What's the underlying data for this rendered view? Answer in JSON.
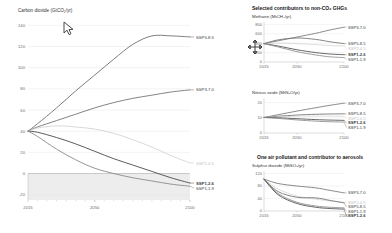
{
  "figure": {
    "background": "#ffffff",
    "line_colors": {
      "ssp585": "#6f6f6f",
      "ssp370": "#757575",
      "ssp245": "#cfcfcf",
      "ssp126": "#4a4a4a",
      "ssp119": "#8a8a8a",
      "grid": "#e6e6e6",
      "axis": "#b5b5b5",
      "negative_band": "#ededed"
    }
  },
  "main": {
    "title": "Carbon dioxide (GtCO₂/yr)",
    "xlabel": "",
    "ylabel": "",
    "xticks": [
      "2015",
      "2050",
      "2100"
    ],
    "yticks": [
      "140",
      "120",
      "100",
      "80",
      "60",
      "40",
      "20",
      "0",
      "-20"
    ],
    "series_labels": {
      "ssp585": "SSP5-8.5",
      "ssp370": "SSP3-7.0",
      "ssp245": "SSP2-4.5",
      "ssp126": "SSP1-2.6",
      "ssp119": "SSP1-1.9"
    }
  },
  "right": {
    "heading": "Selected contributors to non-CO₂ GHGs",
    "pollutant_heading": "One air pollutant and contributor to aerosols",
    "panels": [
      {
        "subtitle": "Methane (MtCH₄/yr)",
        "xticks": [
          "2015",
          "2050",
          "2100"
        ],
        "yticks": [
          "800",
          "600",
          "400",
          "200",
          "0"
        ],
        "labels": [
          "SSP3-7.0",
          "SSP5-8.5",
          "SSP2-4.5",
          "SSP1-2.6",
          "SSP1-1.9"
        ]
      },
      {
        "subtitle": "Nitrous oxide (MtN₂O/yr)",
        "xticks": [
          "2015",
          "2050",
          "2100"
        ],
        "yticks": [
          "20",
          "10",
          "0"
        ],
        "labels": [
          "SSP3-7.0",
          "SSP5-8.5",
          "SSP2-4.5",
          "SSP1-2.6",
          "SSP1-1.9"
        ]
      },
      {
        "subtitle": "Sulphur dioxide (MtSO₂/yr)",
        "xticks": [
          "2015",
          "2050",
          "2100"
        ],
        "yticks": [
          "120",
          "80",
          "40",
          "0"
        ],
        "labels": [
          "SSP3-7.0",
          "SSP2-4.5",
          "SSP5-8.5",
          "SSP1-1.9",
          "SSP1-2.6"
        ]
      }
    ]
  },
  "chart_data": [
    {
      "type": "line",
      "title": "Carbon dioxide (GtCO₂/yr)",
      "xlabel": "",
      "ylabel": "GtCO2/yr",
      "x": [
        2015,
        2020,
        2030,
        2040,
        2050,
        2060,
        2070,
        2080,
        2090,
        2100
      ],
      "xlim": [
        2015,
        2100
      ],
      "ylim": [
        -25,
        145
      ],
      "grid": true,
      "legend_position": "right-inline",
      "series": [
        {
          "name": "SSP5-8.5",
          "values": [
            40,
            47,
            62,
            78,
            93,
            108,
            122,
            130,
            130,
            129
          ]
        },
        {
          "name": "SSP3-7.0",
          "values": [
            40,
            44,
            50,
            56,
            62,
            67,
            71,
            74,
            77,
            79
          ]
        },
        {
          "name": "SSP2-4.5",
          "values": [
            40,
            43,
            45,
            44,
            42,
            38,
            32,
            25,
            17,
            10
          ]
        },
        {
          "name": "SSP1-2.6",
          "values": [
            40,
            39,
            34,
            28,
            21,
            14,
            8,
            2,
            -4,
            -9
          ]
        },
        {
          "name": "SSP1-1.9",
          "values": [
            40,
            35,
            23,
            13,
            5,
            0,
            -4,
            -7,
            -10,
            -12
          ]
        }
      ]
    },
    {
      "type": "line",
      "title": "Methane (MtCH₄/yr)",
      "xlabel": "",
      "ylabel": "MtCH4/yr",
      "x": [
        2015,
        2030,
        2050,
        2070,
        2085,
        2100
      ],
      "xlim": [
        2015,
        2100
      ],
      "ylim": [
        0,
        850
      ],
      "grid": true,
      "legend_position": "right-inline",
      "series": [
        {
          "name": "SSP3-7.0",
          "values": [
            390,
            450,
            530,
            610,
            680,
            740
          ]
        },
        {
          "name": "SSP5-8.5",
          "values": [
            390,
            470,
            510,
            480,
            430,
            390
          ]
        },
        {
          "name": "SSP2-4.5",
          "values": [
            390,
            400,
            390,
            370,
            350,
            340
          ]
        },
        {
          "name": "SSP1-2.6",
          "values": [
            390,
            340,
            260,
            200,
            170,
            155
          ]
        },
        {
          "name": "SSP1-1.9",
          "values": [
            390,
            320,
            220,
            150,
            110,
            95
          ]
        }
      ]
    },
    {
      "type": "line",
      "title": "Nitrous oxide (MtN₂O/yr)",
      "xlabel": "",
      "ylabel": "MtN2O/yr",
      "x": [
        2015,
        2030,
        2050,
        2070,
        2085,
        2100
      ],
      "xlim": [
        2015,
        2100
      ],
      "ylim": [
        0,
        23
      ],
      "grid": true,
      "legend_position": "right-inline",
      "series": [
        {
          "name": "SSP3-7.0",
          "values": [
            10.2,
            12.0,
            14.4,
            16.6,
            18.2,
            19.6
          ]
        },
        {
          "name": "SSP5-8.5",
          "values": [
            10.2,
            11.0,
            11.8,
            12.3,
            12.5,
            12.6
          ]
        },
        {
          "name": "SSP2-4.5",
          "values": [
            10.2,
            10.6,
            11.0,
            11.1,
            11.1,
            11.0
          ]
        },
        {
          "name": "SSP1-2.6",
          "values": [
            10.2,
            10.0,
            9.4,
            8.8,
            8.5,
            8.3
          ]
        },
        {
          "name": "SSP1-1.9",
          "values": [
            10.2,
            9.6,
            8.6,
            7.8,
            7.4,
            7.2
          ]
        }
      ]
    },
    {
      "type": "line",
      "title": "Sulphur dioxide (MtSO₂/yr)",
      "xlabel": "",
      "ylabel": "MtSO2/yr",
      "x": [
        2015,
        2030,
        2050,
        2070,
        2085,
        2100
      ],
      "xlim": [
        2015,
        2100
      ],
      "ylim": [
        0,
        128
      ],
      "grid": true,
      "legend_position": "right-inline",
      "series": [
        {
          "name": "SSP3-7.0",
          "values": [
            102,
            88,
            80,
            74,
            66,
            58
          ]
        },
        {
          "name": "SSP2-4.5",
          "values": [
            102,
            70,
            48,
            38,
            32,
            28
          ]
        },
        {
          "name": "SSP5-8.5",
          "values": [
            102,
            62,
            44,
            42,
            34,
            26
          ]
        },
        {
          "name": "SSP1-1.9",
          "values": [
            102,
            56,
            28,
            16,
            12,
            10
          ]
        },
        {
          "name": "SSP1-2.6",
          "values": [
            102,
            52,
            24,
            12,
            8,
            6
          ]
        }
      ]
    }
  ],
  "cursors": {
    "arrow": "arrow-pointer-cursor",
    "move": "move-crosshair-cursor"
  }
}
